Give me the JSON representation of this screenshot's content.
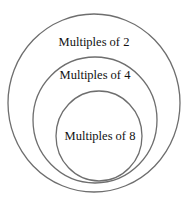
{
  "diagram": {
    "type": "nested-sets",
    "sets": [
      {
        "label": "Multiples of 2",
        "level": "outer"
      },
      {
        "label": "Multiples of 4",
        "level": "middle"
      },
      {
        "label": "Multiples of 8",
        "level": "inner"
      }
    ],
    "colors": {
      "stroke": "#6e6e6e",
      "text": "#111111",
      "background": "#ffffff"
    }
  }
}
